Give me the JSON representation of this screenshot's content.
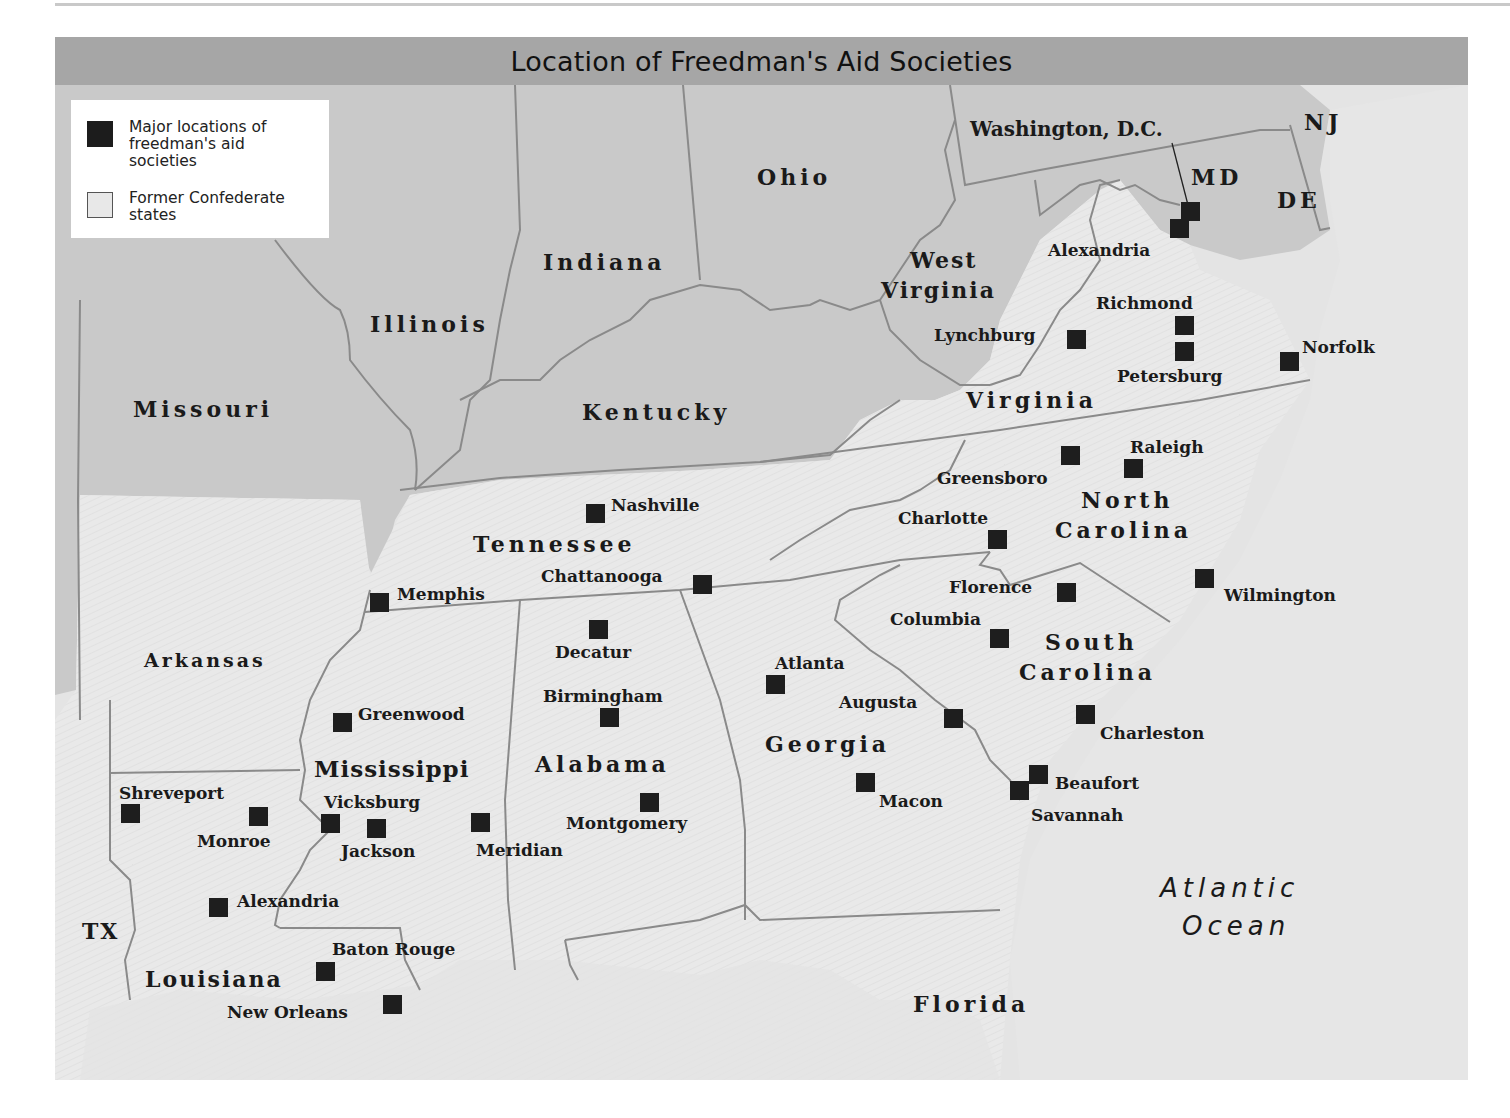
{
  "header": {
    "running_head": ""
  },
  "map": {
    "title": "Location of Freedman's Aid Societies",
    "legend": {
      "items": [
        {
          "label": "Major locations of freedman's aid societies",
          "symbol": "dark-square"
        },
        {
          "label": "Former Confederate states",
          "symbol": "light-square"
        }
      ]
    },
    "colors": {
      "title_bar": "#a6a6a6",
      "union_states": "#c9c9c9",
      "confederate_states": "#e8e8e8",
      "ocean": "#e4e4e4",
      "marker": "#1e1e1e",
      "border": "#8a8a8a"
    },
    "states": {
      "ohio": "Ohio",
      "indiana": "Indiana",
      "illinois": "Illinois",
      "missouri": "Missouri",
      "kentucky": "Kentucky",
      "west_virginia_1": "West",
      "west_virginia_2": "Virginia",
      "virginia": "Virginia",
      "md": "MD",
      "de": "DE",
      "nj": "NJ",
      "north_carolina_1": "North",
      "north_carolina_2": "Carolina",
      "tennessee": "Tennessee",
      "south_carolina_1": "South",
      "south_carolina_2": "Carolina",
      "arkansas": "Arkansas",
      "mississippi": "Mississippi",
      "alabama": "Alabama",
      "georgia": "Georgia",
      "louisiana": "Louisiana",
      "tx": "TX",
      "florida": "Florida"
    },
    "water": {
      "ocean_1": "Atlantic",
      "ocean_2": "Ocean"
    },
    "cities": [
      {
        "name": "Washington, D.C.",
        "x": 1190,
        "y": 211
      },
      {
        "name": "Alexandria",
        "x": 1179,
        "y": 228
      },
      {
        "name": "Richmond",
        "x": 1184,
        "y": 325
      },
      {
        "name": "Petersburg",
        "x": 1184,
        "y": 351
      },
      {
        "name": "Lynchburg",
        "x": 1076,
        "y": 339
      },
      {
        "name": "Norfolk",
        "x": 1289,
        "y": 361
      },
      {
        "name": "Greensboro",
        "x": 1070,
        "y": 455
      },
      {
        "name": "Raleigh",
        "x": 1133,
        "y": 468
      },
      {
        "name": "Charlotte",
        "x": 997,
        "y": 539
      },
      {
        "name": "Wilmington",
        "x": 1204,
        "y": 578
      },
      {
        "name": "Florence",
        "x": 1066,
        "y": 592
      },
      {
        "name": "Columbia",
        "x": 999,
        "y": 638
      },
      {
        "name": "Charleston",
        "x": 1085,
        "y": 714
      },
      {
        "name": "Augusta",
        "x": 953,
        "y": 718
      },
      {
        "name": "Atlanta",
        "x": 775,
        "y": 684
      },
      {
        "name": "Macon",
        "x": 865,
        "y": 782
      },
      {
        "name": "Beaufort",
        "x": 1038,
        "y": 774
      },
      {
        "name": "Savannah",
        "x": 1019,
        "y": 790
      },
      {
        "name": "Nashville",
        "x": 595,
        "y": 513
      },
      {
        "name": "Chattanooga",
        "x": 702,
        "y": 584
      },
      {
        "name": "Memphis",
        "x": 379,
        "y": 602
      },
      {
        "name": "Decatur",
        "x": 598,
        "y": 629
      },
      {
        "name": "Birmingham",
        "x": 609,
        "y": 717
      },
      {
        "name": "Montgomery",
        "x": 649,
        "y": 802
      },
      {
        "name": "Greenwood",
        "x": 342,
        "y": 722
      },
      {
        "name": "Vicksburg",
        "x": 330,
        "y": 823
      },
      {
        "name": "Jackson",
        "x": 376,
        "y": 828
      },
      {
        "name": "Meridian",
        "x": 480,
        "y": 822
      },
      {
        "name": "Shreveport",
        "x": 130,
        "y": 813
      },
      {
        "name": "Monroe",
        "x": 258,
        "y": 816
      },
      {
        "name": "Alexandria",
        "x": 218,
        "y": 907
      },
      {
        "name": "Baton Rouge",
        "x": 325,
        "y": 971
      },
      {
        "name": "New Orleans",
        "x": 392,
        "y": 1004
      }
    ]
  }
}
